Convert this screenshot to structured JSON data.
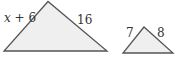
{
  "figure": {
    "large_triangle": {
      "left_side_label_var": "x",
      "left_side_label_rest": " + 6",
      "right_side_label": "16"
    },
    "small_triangle": {
      "left_side_label": "7",
      "right_side_label": "8"
    },
    "colors": {
      "fill": "#efefef",
      "stroke": "#555555",
      "text": "#333333"
    }
  }
}
